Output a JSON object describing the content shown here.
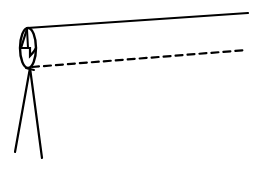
{
  "diagram": {
    "title": "",
    "elements": [
      {
        "name": "observer-eye",
        "shape": "ellipse"
      },
      {
        "name": "line-of-sight",
        "style": "solid"
      },
      {
        "name": "horizontal-reference-line",
        "style": "dashed"
      },
      {
        "name": "stand-leg-left",
        "style": "solid"
      },
      {
        "name": "stand-leg-right",
        "style": "solid"
      }
    ],
    "colors": {
      "stroke": "#000000",
      "background": "#ffffff"
    }
  }
}
